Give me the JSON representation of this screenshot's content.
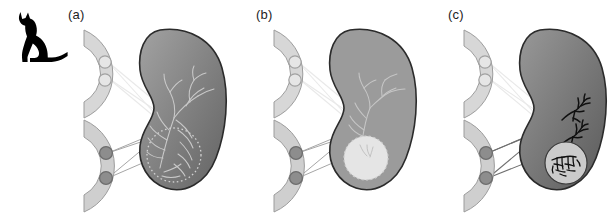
{
  "figure": {
    "type": "scientific-diagram",
    "background_color": "#ffffff",
    "width": 606,
    "height": 212
  },
  "animal": {
    "name": "cat-silhouette",
    "label": "cat",
    "color": "#000000"
  },
  "colors": {
    "spinal_segment_fill_light": "#d9d9d9",
    "spinal_segment_fill": "#cdcdcd",
    "spinal_segment_stroke": "#9a9a9a",
    "neuron_open_fill": "#e2e2e2",
    "neuron_open_stroke": "#9d9d9d",
    "neuron_filled_fill": "#8e8e8e",
    "neuron_filled_stroke": "#6e6e6e",
    "kidney_stroke": "#2b2b2b",
    "kidney_fill_dark": "#6f6f6f",
    "kidney_fill_mid": "#8c8c8c",
    "kidney_fill_flat": "#9a9a9a",
    "axon_faint": "#e8e8e8",
    "axon_visible": "#9e9e9e",
    "branch_faint": "#b9b9b9",
    "branch_dark": "#111111",
    "capsule_light": "#dcdcdc",
    "capsule_white": "#eeeeee",
    "label_color": "#1d1d1d"
  },
  "panels": [
    {
      "id": "a",
      "label": "(a)",
      "left": 64,
      "label_x": 68,
      "label_y": 10,
      "kidney": {
        "name": "kidney-a",
        "fill_style": "gradient",
        "fill_from": "#9a9a9a",
        "fill_to": "#6a6a6a",
        "branching": "faint-light",
        "branch_color": "#c8c8c8",
        "capsule": {
          "present": true,
          "style": "dotted-outline",
          "fill": "none",
          "description": "dotted circle around lower branch plexus"
        }
      },
      "segments": [
        {
          "name": "spinal-segment-upper-a",
          "position": "upper",
          "neurons": [
            {
              "name": "neuron-open-1",
              "style": "open"
            },
            {
              "name": "neuron-open-2",
              "style": "open"
            }
          ]
        },
        {
          "name": "spinal-segment-lower-a",
          "position": "lower",
          "neurons": [
            {
              "name": "neuron-filled-1",
              "style": "filled"
            },
            {
              "name": "neuron-filled-2",
              "style": "filled"
            }
          ]
        }
      ]
    },
    {
      "id": "b",
      "label": "(b)",
      "left": 254,
      "label_x": 256,
      "label_y": 10,
      "kidney": {
        "name": "kidney-b",
        "fill_style": "flat",
        "fill_from": "#9a9a9a",
        "fill_to": "#9a9a9a",
        "branching": "faint-light",
        "branch_color": "#c4c4c4",
        "capsule": {
          "present": true,
          "style": "filled-light",
          "fill": "#e4e4e4",
          "description": "pale filled circle with ragged dashed border"
        }
      },
      "segments": [
        {
          "name": "spinal-segment-upper-b",
          "position": "upper",
          "neurons": [
            {
              "name": "neuron-open-1",
              "style": "open"
            },
            {
              "name": "neuron-open-2",
              "style": "open"
            }
          ]
        },
        {
          "name": "spinal-segment-lower-b",
          "position": "lower",
          "neurons": [
            {
              "name": "neuron-filled-1",
              "style": "filled"
            },
            {
              "name": "neuron-filled-2",
              "style": "filled"
            }
          ]
        }
      ]
    },
    {
      "id": "c",
      "label": "(c)",
      "left": 444,
      "label_x": 448,
      "label_y": 10,
      "kidney": {
        "name": "kidney-c",
        "fill_style": "gradient",
        "fill_from": "#8f8f8f",
        "fill_to": "#5f5f5f",
        "branching": "dark-tufts",
        "branch_color": "#111111",
        "capsule": {
          "present": true,
          "style": "filled-light-with-dark-branches",
          "fill": "#cfcfcf",
          "description": "pale circle containing dense black branch tufts"
        }
      },
      "segments": [
        {
          "name": "spinal-segment-upper-c",
          "position": "upper",
          "neurons": [
            {
              "name": "neuron-open-1",
              "style": "open"
            },
            {
              "name": "neuron-open-2",
              "style": "open"
            }
          ]
        },
        {
          "name": "spinal-segment-lower-c",
          "position": "lower",
          "neurons": [
            {
              "name": "neuron-filled-1",
              "style": "filled"
            },
            {
              "name": "neuron-filled-2",
              "style": "filled"
            }
          ]
        }
      ]
    }
  ]
}
